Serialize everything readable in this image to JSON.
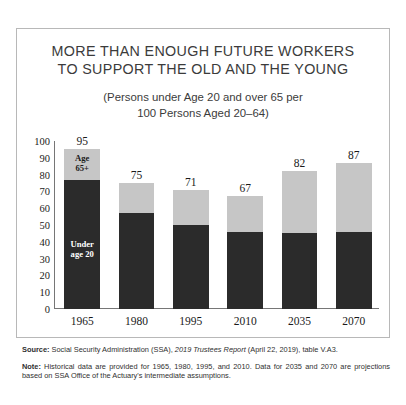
{
  "figure": {
    "title_lines": [
      "MORE THAN ENOUGH FUTURE WORKERS",
      "TO SUPPORT THE OLD AND THE YOUNG"
    ],
    "subtitle_lines": [
      "(Persons under Age 20 and over 65 per",
      "100 Persons Aged 20–64)"
    ],
    "inbar_labels": {
      "old_line1": "Age",
      "old_line2": "65+",
      "young_line1": "Under",
      "young_line2": "age 20"
    },
    "colors": {
      "old_segment": "#c6c6c6",
      "young_segment": "#2b2b2b",
      "axis": "#767676",
      "border": "#b8b8b8",
      "text": "#231f20"
    }
  },
  "chart_data": {
    "type": "bar",
    "title": "MORE THAN ENOUGH FUTURE WORKERS TO SUPPORT THE OLD AND THE YOUNG",
    "subtitle": "(Persons under Age 20 and over 65 per 100 Persons Aged 20–64)",
    "stacked": true,
    "xlabel": "",
    "ylabel": "",
    "ylim": [
      0,
      100
    ],
    "yticks": [
      100,
      90,
      80,
      70,
      60,
      50,
      40,
      30,
      20,
      10,
      0
    ],
    "grid": false,
    "legend": "in-bar",
    "categories": [
      "1965",
      "1980",
      "1995",
      "2010",
      "2035",
      "2070"
    ],
    "totals": [
      95,
      75,
      71,
      67,
      82,
      87
    ],
    "series": [
      {
        "name": "Under age 20",
        "values": [
          77,
          57,
          50,
          46,
          45,
          46
        ]
      },
      {
        "name": "Age 65+",
        "values": [
          18,
          18,
          21,
          21,
          37,
          41
        ]
      }
    ]
  },
  "footnotes": {
    "source_label": "Source:",
    "source_text_1": " Social Security Administration (SSA), ",
    "source_italic": "2019 Trustees Report",
    "source_text_2": " (April 22, 2019), table V.A3.",
    "note_label": "Note:",
    "note_text": " Historical data are provided for 1965, 1980, 1995, and 2010. Data for 2035 and 2070 are projections based on SSA Office of the Actuary's intermediate assumptions."
  }
}
